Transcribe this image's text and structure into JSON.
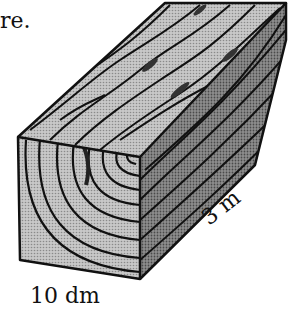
{
  "figure": {
    "caption_fragment": "re.",
    "dimensions": {
      "width_label": "10 dm",
      "length_label": "3 m"
    },
    "colors": {
      "outline": "#111111",
      "front_face": "#b8b8b8",
      "top_face": "#a8a8a8",
      "side_face": "#7c7c7c",
      "grain_dark": "#555555",
      "background": "#ffffff"
    }
  }
}
